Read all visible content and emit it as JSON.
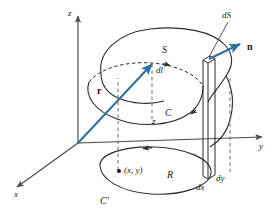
{
  "figure": {
    "colors": {
      "axis": "#4a4a4a",
      "curve": "#2b2b2b",
      "vector": "#2e6f9e",
      "label": "#1a1a1a",
      "background": "#ffffff"
    }
  },
  "axes": {
    "z_label": "z",
    "y_label": "y",
    "x_label": "x"
  },
  "labels": {
    "surface": "S",
    "surface_element": "dS",
    "normal": "n",
    "line_element": "dl",
    "boundary_curve": "C",
    "projected_curve": "C'",
    "region": "R",
    "point": "(x, y)",
    "dx": "dx",
    "dy": "dy",
    "height": "z",
    "position_vector": "r"
  }
}
